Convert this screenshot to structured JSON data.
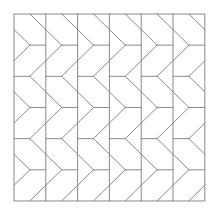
{
  "diagram": {
    "title": "",
    "type": "chevron tessellation pattern",
    "background": "#ffffff",
    "line_color": "#8a8a8a",
    "line_width": 1,
    "grid": {
      "origin_x": 14,
      "origin_y": 14,
      "columns": 6,
      "column_width": 31.8,
      "unit": 15.58,
      "units_tall": 12
    },
    "column_segments_in_units": [
      [
        1,
        0,
        2,
        1
      ],
      [
        0,
        1,
        1,
        2
      ],
      [
        1,
        2,
        2,
        2
      ],
      [
        1,
        2,
        0,
        3
      ],
      [
        2,
        3,
        1,
        4
      ],
      [
        0,
        4,
        1,
        4
      ],
      [
        1,
        4,
        2,
        5
      ],
      [
        0,
        5,
        1,
        6
      ],
      [
        1,
        6,
        2,
        6
      ],
      [
        1,
        6,
        0,
        7
      ],
      [
        2,
        7,
        1,
        8
      ],
      [
        0,
        8,
        1,
        8
      ],
      [
        1,
        8,
        2,
        9
      ],
      [
        0,
        9,
        1,
        10
      ],
      [
        1,
        10,
        2,
        10
      ],
      [
        1,
        10,
        0,
        11
      ],
      [
        2,
        11,
        1,
        12
      ]
    ]
  }
}
